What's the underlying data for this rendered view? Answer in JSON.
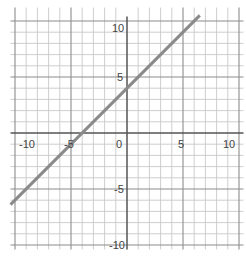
{
  "chart_data": {
    "type": "line",
    "title": "",
    "xlabel": "",
    "ylabel": "",
    "xlim": [
      -10,
      10
    ],
    "ylim": [
      -10,
      10
    ],
    "grid": true,
    "grid_step": 1,
    "major_step": 5,
    "x_tick_labels": [
      "-10",
      "-5",
      "0",
      "5",
      "10"
    ],
    "y_tick_labels": [
      "10",
      "5",
      "-5",
      "-10"
    ],
    "series": [
      {
        "name": "y = x + 4",
        "equation": "y = x + 4",
        "slope": 1,
        "intercept": 4,
        "x": [
          -10.4,
          6.5
        ],
        "y": [
          -6.4,
          10.5
        ],
        "color": "#8a8a8a"
      }
    ],
    "legend": null
  },
  "colors": {
    "grid_minor": "#c8c8c8",
    "grid_major": "#8c8c8c",
    "axis": "#555555",
    "line": "#8a8a8a"
  }
}
